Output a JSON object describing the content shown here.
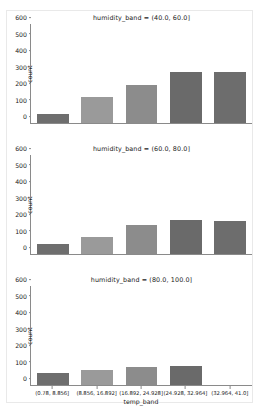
{
  "figure": {
    "facet_variable": "humidity_band",
    "xlabel": "temp_band",
    "ylabel": "count"
  },
  "chart_data": {
    "type": "bar",
    "title": "",
    "xlabel": "temp_band",
    "ylabel": "count",
    "ylim": [
      0,
      600
    ],
    "yticks": [
      0,
      100,
      200,
      300,
      400,
      500,
      600
    ],
    "grid": false,
    "legend": "none",
    "facet_variable": "humidity_band",
    "facet_layout": "3 rows x 1 column, shared x and y axes",
    "categories": [
      "(0.78, 8.856]",
      "(8.856, 16.892]",
      "(16.892, 24.928]",
      "(24.928, 32.964]",
      "(32.964, 41.0]"
    ],
    "panels": [
      {
        "facet_value": "(40.0, 60.0]",
        "title": "humidity_band = (40.0, 60.0]",
        "values": [
          57,
          155,
          228,
          311,
          312
        ],
        "bar_colors": [
          "#6e6e6e",
          "#9a9a9a",
          "#8c8c8c",
          "#6a6a6a",
          "#6d6d6d"
        ]
      },
      {
        "facet_value": "(60.0, 80.0]",
        "title": "humidity_band = (60.0, 80.0]",
        "values": [
          63,
          105,
          175,
          208,
          198
        ],
        "bar_colors": [
          "#6e6e6e",
          "#9a9a9a",
          "#8c8c8c",
          "#6a6a6a",
          "#6d6d6d"
        ]
      },
      {
        "facet_value": "(80.0, 100.0]",
        "title": "humidity_band = (80.0, 100.0]",
        "values": [
          70,
          88,
          110,
          118,
          0
        ],
        "bar_colors": [
          "#6e6e6e",
          "#9a9a9a",
          "#8c8c8c",
          "#6a6a6a",
          "#6d6d6d"
        ]
      }
    ]
  }
}
